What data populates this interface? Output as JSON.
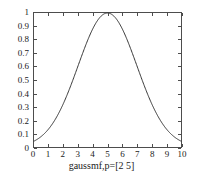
{
  "figure": {
    "background_color": "#ffffff",
    "axis_color": "#4d4d4d",
    "curve_color": "#333333"
  },
  "chart_data": {
    "type": "line",
    "title": "",
    "subtitle": "",
    "xlabel": "gaussmf,p=[2 5]",
    "ylabel": "",
    "xlim": [
      0,
      10
    ],
    "ylim": [
      0,
      1
    ],
    "grid": false,
    "legend": null,
    "legend_position": "none",
    "xticks": [
      0,
      1,
      2,
      3,
      4,
      5,
      6,
      7,
      8,
      9,
      10
    ],
    "xticklabels": [
      "0",
      "1",
      "2",
      "3",
      "4",
      "5",
      "6",
      "7",
      "8",
      "9",
      "10"
    ],
    "yticks": [
      0,
      0.1,
      0.2,
      0.3,
      0.4,
      0.5,
      0.6,
      0.7,
      0.8,
      0.9,
      1
    ],
    "yticklabels": [
      "0",
      "0.1",
      "0.2",
      "0.3",
      "0.4",
      "0.5",
      "0.6",
      "0.7",
      "0.8",
      "0.9",
      "1"
    ],
    "function": "gaussmf",
    "parameters": {
      "sigma": 2,
      "c": 5
    },
    "x": [
      0,
      0.25,
      0.5,
      0.75,
      1,
      1.25,
      1.5,
      1.75,
      2,
      2.25,
      2.5,
      2.75,
      3,
      3.25,
      3.5,
      3.75,
      4,
      4.25,
      4.5,
      4.75,
      5,
      5.25,
      5.5,
      5.75,
      6,
      6.25,
      6.5,
      6.75,
      7,
      7.25,
      7.5,
      7.75,
      8,
      8.25,
      8.5,
      8.75,
      9,
      9.25,
      9.5,
      9.75,
      10
    ],
    "values": [
      0.0439,
      0.0561,
      0.0709,
      0.0889,
      0.1054,
      0.1354,
      0.1654,
      0.2008,
      0.2369,
      0.278,
      0.3247,
      0.3753,
      0.4286,
      0.4839,
      0.5394,
      0.5942,
      0.6456,
      0.6977,
      0.7437,
      0.7845,
      0.8144,
      0.846,
      0.8642,
      0.8787,
      0.8825,
      0.8787,
      0.8642,
      0.846,
      0.8144,
      0.7845,
      0.7437,
      0.6977,
      0.6456,
      0.5942,
      0.5394,
      0.4839,
      0.4286,
      0.3753,
      0.3247,
      0.278,
      0.2369
    ],
    "series": [
      {
        "name": "gaussmf,p=[2 5]",
        "formula": "exp(-(x-5)^2/(2*2^2))",
        "peak_x": 5,
        "peak_y": 1,
        "endpoint_values": {
          "x0": 0.0439,
          "x10": 0.0439
        }
      }
    ]
  }
}
